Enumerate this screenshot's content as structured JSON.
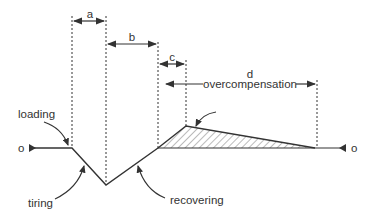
{
  "diagram": {
    "type": "supercompensation-curve",
    "colors": {
      "line": "#333333",
      "hatch": "#555555",
      "background": "#ffffff"
    },
    "intervals": [
      {
        "id": "a",
        "label": "a"
      },
      {
        "id": "b",
        "label": "b"
      },
      {
        "id": "c",
        "label": "c"
      },
      {
        "id": "d",
        "label": "d",
        "caption": "overcompensation"
      }
    ],
    "phases": {
      "loading": "loading",
      "tiring": "tiring",
      "recovering": "recovering"
    },
    "baseline_markers": {
      "left": "o",
      "right": "o"
    }
  }
}
